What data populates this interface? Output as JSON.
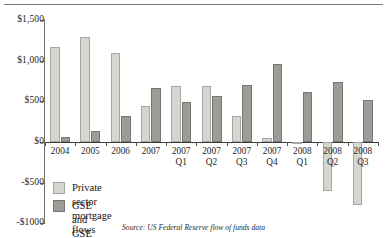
{
  "figure": {
    "source_note": "Source: US Federal Reserve flow of funds data"
  },
  "legend": {
    "position": "inside-bottom-left",
    "items": [
      {
        "label": "Private sector mortgage flows",
        "color": "#d6d6d1",
        "swatch": "light"
      },
      {
        "label": "GSE and GSE Pool",
        "color": "#9d9d98",
        "swatch": "dark"
      }
    ]
  },
  "axis": {
    "y_ticks": [
      {
        "label": "$1,500",
        "value": 1500
      },
      {
        "label": "$1,000",
        "value": 1000
      },
      {
        "label": "$500",
        "value": 500
      },
      {
        "label": "$0",
        "value": 0
      },
      {
        "label": "-$500",
        "value": -500
      },
      {
        "label": "-$1000",
        "value": -1000
      }
    ]
  },
  "chart_data": {
    "type": "bar",
    "title": "",
    "subtitle": "",
    "xlabel": "",
    "ylabel": "",
    "ylim": [
      -1000,
      1500
    ],
    "grid": false,
    "legend_position": "inside-bottom-left",
    "annotations": [
      "Source: US Federal Reserve flow of funds data"
    ],
    "ytick_labels": [
      "$1,500",
      "$1,000",
      "$500",
      "$0",
      "-$500",
      "-$1000"
    ],
    "ytick_values": [
      1500,
      1000,
      500,
      0,
      -500,
      -1000
    ],
    "categories": [
      "2004",
      "2005",
      "2006",
      "2007",
      "2007 Q1",
      "2007 Q2",
      "2007 Q3",
      "2007 Q4",
      "2008 Q1",
      "2008 Q2",
      "2008 Q3"
    ],
    "category_lines": [
      [
        "2004",
        ""
      ],
      [
        "2005",
        ""
      ],
      [
        "2006",
        ""
      ],
      [
        "2007",
        ""
      ],
      [
        "2007",
        "Q1"
      ],
      [
        "2007",
        "Q2"
      ],
      [
        "2007",
        "Q3"
      ],
      [
        "2007",
        "Q4"
      ],
      [
        "2008",
        "Q1"
      ],
      [
        "2008",
        "Q2"
      ],
      [
        "2008",
        "Q3"
      ]
    ],
    "series": [
      {
        "name": "Private sector mortgage flows",
        "color": "#d6d6d1",
        "values": [
          1165,
          1285,
          1090,
          440,
          690,
          690,
          325,
          50,
          -20,
          -600,
          -775
        ]
      },
      {
        "name": "GSE and GSE Pool",
        "color": "#9d9d98",
        "values": [
          60,
          135,
          325,
          670,
          490,
          570,
          700,
          960,
          610,
          740,
          520
        ]
      }
    ]
  }
}
